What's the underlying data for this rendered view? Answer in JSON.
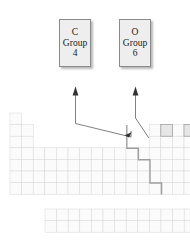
{
  "figure": {
    "kind": "periodic-table-callout-diagram"
  },
  "callouts": [
    {
      "id": "carbon",
      "symbol": "C",
      "group_label": "Group",
      "group_number": "4",
      "points_to": "carbon-cell"
    },
    {
      "id": "oxygen",
      "symbol": "O",
      "group_label": "Group",
      "group_number": "6",
      "points_to": "oxygen-cell"
    }
  ],
  "table": {
    "cell_width": 11.6,
    "cell_height": 11.6,
    "origin_x": 10,
    "origin_y": 113,
    "main_rows": 7,
    "main_cols": 18,
    "fblock_rows": 2,
    "fblock_cols": 14,
    "fblock_origin_x": 45,
    "fblock_origin_y": 209,
    "highlighted_cells": [
      {
        "name": "carbon-cell",
        "col": 14,
        "row": 2
      },
      {
        "name": "oxygen-cell",
        "col": 16,
        "row": 2
      }
    ],
    "staircase_label": "metal-nonmetal-divider"
  },
  "colors": {
    "callout_fill": "#eeeeee",
    "callout_border": "#8a8a8a",
    "cell_fill": "#fbfbfb",
    "cell_stroke": "#d8d8d8",
    "highlight_fill": "#e6e6e6",
    "highlight_stroke": "#9a9a9a",
    "stair_stroke": "#9f9f9f",
    "leader_stroke": "#555555",
    "text": "#1a1a1a",
    "background": "#ffffff"
  }
}
